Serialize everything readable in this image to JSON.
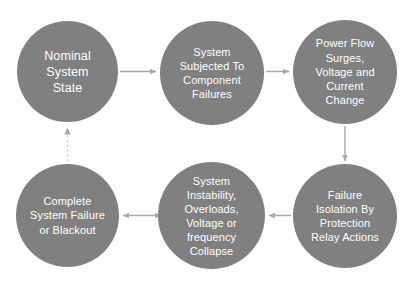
{
  "diagram": {
    "type": "cycle-flowchart",
    "background_color": "#fdfdfd",
    "node_color": "#808080",
    "node_text_color": "#ffffff",
    "connector_color": "#a8a8a8",
    "nodes": [
      {
        "id": "nominal",
        "label": "Nominal\nSystem\nState",
        "order": 1
      },
      {
        "id": "subjected",
        "label": "System\nSubjected To\nComponent\nFailures",
        "order": 2
      },
      {
        "id": "powerflow",
        "label": "Power Flow\nSurges,\nVoltage and\nCurrent\nChange",
        "order": 3
      },
      {
        "id": "isolation",
        "label": "Failure\nIsolation By\nProtection\nRelay Actions",
        "order": 4
      },
      {
        "id": "instability",
        "label": "System\nInstability,\nOverloads,\nVoltage or\nfrequency\nCollapse",
        "order": 5
      },
      {
        "id": "blackout",
        "label": "Complete\nSystem Failure\nor Blackout",
        "order": 6
      }
    ],
    "connectors": [
      {
        "id": "nominal-to-subjected",
        "from": "nominal",
        "to": "subjected",
        "style": "solid",
        "direction": "right"
      },
      {
        "id": "subjected-to-powerflow",
        "from": "subjected",
        "to": "powerflow",
        "style": "solid",
        "direction": "right"
      },
      {
        "id": "powerflow-to-isolation",
        "from": "powerflow",
        "to": "isolation",
        "style": "solid",
        "direction": "down"
      },
      {
        "id": "isolation-to-instability",
        "from": "isolation",
        "to": "instability",
        "style": "solid",
        "direction": "left"
      },
      {
        "id": "instability-to-blackout",
        "from": "instability",
        "to": "blackout",
        "style": "solid",
        "direction": "bidirectional"
      },
      {
        "id": "blackout-to-nominal",
        "from": "blackout",
        "to": "nominal",
        "style": "dotted",
        "direction": "up"
      }
    ]
  }
}
